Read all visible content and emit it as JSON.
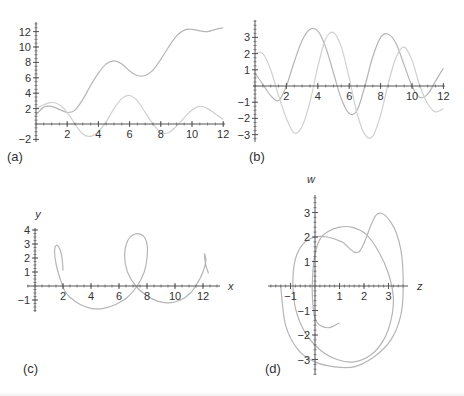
{
  "figure": {
    "panels": [
      {
        "id": "a",
        "label": "(a)"
      },
      {
        "id": "b",
        "label": "(b)"
      },
      {
        "id": "c",
        "label": "(c)"
      },
      {
        "id": "d",
        "label": "(d)"
      }
    ]
  },
  "colors": {
    "curve_dark": "#b5b5b5",
    "curve_light": "#d0d0d0",
    "axis": "#555555",
    "text": "#333333"
  },
  "chart_data": [
    {
      "panel": "(a)",
      "type": "line",
      "title": "",
      "xlabel": "",
      "ylabel": "",
      "xlim": [
        0,
        12
      ],
      "ylim": [
        -2,
        13
      ],
      "x_ticks": [
        2,
        4,
        6,
        8,
        10,
        12
      ],
      "y_ticks": [
        -2,
        2,
        4,
        6,
        8,
        10,
        12
      ],
      "series": [
        {
          "name": "rising curve",
          "x": [
            0,
            0.5,
            1,
            1.5,
            2,
            2.5,
            3,
            3.5,
            4,
            4.5,
            5,
            5.5,
            6,
            6.5,
            7,
            7.5,
            8,
            8.5,
            9,
            9.5,
            10,
            10.5,
            11,
            11.5,
            12
          ],
          "y": [
            1.2,
            2.2,
            2.3,
            1.9,
            1.5,
            1.8,
            3.2,
            5.0,
            6.6,
            7.8,
            8.2,
            7.8,
            6.9,
            6.3,
            6.3,
            7.0,
            8.4,
            10.0,
            11.4,
            12.2,
            12.3,
            12.1,
            12.0,
            12.3,
            12.5
          ]
        },
        {
          "name": "oscillating curve",
          "x": [
            0,
            0.5,
            1,
            1.5,
            2,
            2.5,
            3,
            3.5,
            4,
            4.5,
            5,
            5.5,
            6,
            6.5,
            7,
            7.5,
            8,
            8.5,
            9,
            9.5,
            10,
            10.5,
            11,
            11.5,
            12
          ],
          "y": [
            2.0,
            2.5,
            2.8,
            2.5,
            1.5,
            0.0,
            -1.3,
            -1.6,
            -1.0,
            0.3,
            2.0,
            3.3,
            3.7,
            3.0,
            1.5,
            0.0,
            -1.1,
            -1.1,
            -0.3,
            0.8,
            1.8,
            2.3,
            2.0,
            1.3,
            0.6
          ]
        }
      ]
    },
    {
      "panel": "(b)",
      "type": "line",
      "title": "",
      "xlabel": "",
      "ylabel": "",
      "xlim": [
        0,
        12
      ],
      "ylim": [
        -3.3,
        3.9
      ],
      "x_ticks": [
        2,
        4,
        6,
        8,
        10,
        12
      ],
      "y_ticks": [
        -3,
        -2,
        -1,
        1,
        2,
        3
      ],
      "series": [
        {
          "name": "curve 1",
          "x": [
            0,
            0.5,
            1,
            1.5,
            2,
            2.5,
            3,
            3.5,
            4,
            4.5,
            5,
            5.5,
            6,
            6.5,
            7,
            7.5,
            8,
            8.5,
            9,
            9.5,
            10,
            10.5,
            11,
            11.5,
            12
          ],
          "y": [
            0.8,
            0.1,
            -0.6,
            -0.9,
            0.0,
            1.5,
            2.8,
            3.5,
            3.4,
            2.4,
            0.8,
            -0.8,
            -1.7,
            -1.5,
            0.0,
            1.8,
            3.0,
            3.2,
            2.6,
            1.3,
            0.0,
            -0.7,
            -0.5,
            0.3,
            1.1
          ]
        },
        {
          "name": "curve 2",
          "x": [
            0,
            0.5,
            1,
            1.5,
            2,
            2.5,
            3,
            3.5,
            4,
            4.5,
            5,
            5.5,
            6,
            6.5,
            7,
            7.5,
            8,
            8.5,
            9,
            9.5,
            10,
            10.5,
            11,
            11.5,
            12
          ],
          "y": [
            2.0,
            2.0,
            1.0,
            -0.6,
            -2.0,
            -2.9,
            -2.5,
            -1.0,
            1.2,
            2.9,
            3.3,
            2.4,
            0.5,
            -1.7,
            -3.0,
            -3.1,
            -1.8,
            0.2,
            1.8,
            2.4,
            1.6,
            0.0,
            -1.1,
            -1.6,
            -1.4
          ]
        }
      ]
    },
    {
      "panel": "(c)",
      "type": "line",
      "title": "",
      "xlabel": "x",
      "ylabel": "y",
      "xlim": [
        0,
        13
      ],
      "ylim": [
        -1.8,
        4.2
      ],
      "x_ticks": [
        2,
        4,
        6,
        8,
        10,
        12
      ],
      "y_ticks": [
        -1,
        1,
        2,
        3,
        4
      ],
      "series": [
        {
          "name": "parametric curve",
          "x": [
            2.0,
            1.9,
            1.6,
            1.4,
            1.5,
            1.8,
            2.1,
            2.5,
            3.2,
            4.0,
            4.9,
            5.8,
            6.6,
            7.3,
            7.8,
            8.0,
            8.0,
            7.7,
            7.1,
            6.6,
            6.4,
            6.6,
            7.2,
            8.0,
            8.8,
            9.6,
            10.4,
            11.1,
            11.6,
            12.0,
            12.2,
            12.1,
            12.2,
            12.4
          ],
          "y": [
            1.1,
            2.2,
            2.9,
            2.6,
            1.6,
            0.5,
            -0.3,
            -0.8,
            -1.3,
            -1.6,
            -1.6,
            -1.3,
            -0.8,
            0.0,
            1.0,
            2.0,
            3.0,
            3.6,
            3.7,
            3.2,
            2.2,
            1.0,
            0.0,
            -0.7,
            -1.1,
            -1.2,
            -1.0,
            -0.5,
            0.2,
            1.0,
            1.8,
            2.3,
            1.5,
            0.9
          ]
        }
      ]
    },
    {
      "panel": "(d)",
      "type": "line",
      "title": "",
      "xlabel": "z",
      "ylabel": "w",
      "xlim": [
        -1.7,
        3.5
      ],
      "ylim": [
        -3.4,
        3.7
      ],
      "x_ticks": [
        -1,
        1,
        2,
        3
      ],
      "y_ticks": [
        -3,
        -2,
        -1,
        1,
        2,
        3
      ],
      "series": [
        {
          "name": "spiral curve",
          "x": [
            1.0,
            0.6,
            0.2,
            0.0,
            -0.1,
            -0.1,
            0.0,
            0.2,
            0.5,
            1.0,
            1.5,
            2.1,
            2.6,
            3.0,
            3.2,
            3.1,
            2.8,
            2.3,
            1.6,
            0.9,
            0.2,
            -0.4,
            -0.8,
            -0.9,
            -0.8,
            -0.5,
            0.0,
            0.5,
            1.1,
            1.8,
            2.5,
            3.1,
            3.5,
            3.6,
            3.5,
            3.1,
            2.4,
            1.6,
            0.8,
            0.0,
            -0.7,
            -1.2,
            -1.4
          ],
          "y": [
            -1.5,
            -1.7,
            -1.6,
            -1.3,
            -0.6,
            0.4,
            1.3,
            1.9,
            2.2,
            2.4,
            2.4,
            2.1,
            1.4,
            0.5,
            -0.5,
            -1.4,
            -2.2,
            -2.8,
            -3.1,
            -3.0,
            -2.6,
            -1.9,
            -0.9,
            0.2,
            1.1,
            1.7,
            2.0,
            2.0,
            1.8,
            1.4,
            2.9,
            2.6,
            1.5,
            0.0,
            -1.2,
            -2.2,
            -2.9,
            -3.3,
            -3.3,
            -3.1,
            -2.6,
            -1.6,
            0.0
          ]
        }
      ]
    }
  ]
}
